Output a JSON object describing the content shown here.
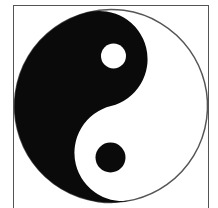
{
  "symbol": {
    "name": "yin-yang",
    "colors": {
      "dark": "#0a0a0a",
      "light": "#ffffff",
      "outline": "#555555",
      "frame": "#555555"
    }
  }
}
